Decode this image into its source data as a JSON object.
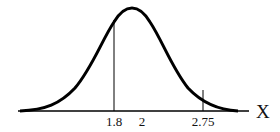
{
  "diagram": {
    "type": "normal-distribution-curve",
    "axis_label": "X",
    "tick_labels": [
      {
        "value": "1.8",
        "x": 114
      },
      {
        "value": "2",
        "x": 142
      },
      {
        "value": "2.75",
        "x": 203
      }
    ],
    "vertical_markers": [
      {
        "at": "1.8",
        "x": 114,
        "top_y": 20
      },
      {
        "at": "2.75",
        "x": 203,
        "top_y": 90
      }
    ],
    "colors": {
      "line": "#000000",
      "background": "#ffffff"
    }
  }
}
